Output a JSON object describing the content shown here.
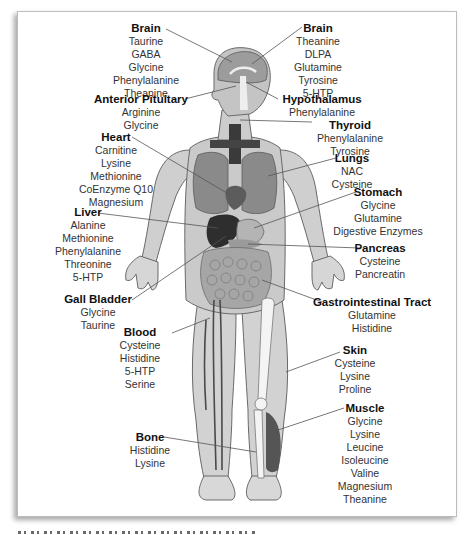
{
  "figure": {
    "type": "anatomical diagram"
  },
  "labels": [
    {
      "id": "brain-left",
      "title": "Brain",
      "items": [
        "Taurine",
        "GABA",
        "Glycine",
        "Phenylalanine",
        "Theanine"
      ]
    },
    {
      "id": "brain-right",
      "title": "Brain",
      "items": [
        "Theanine",
        "DLPA",
        "Glutamine",
        "Tyrosine",
        "5-HTP"
      ]
    },
    {
      "id": "anterior-pituitary",
      "title": "Anterior Pituitary",
      "items": [
        "Arginine",
        "Glycine"
      ]
    },
    {
      "id": "hypothalamus",
      "title": "Hypothalamus",
      "items": [
        "Phenylalanine"
      ]
    },
    {
      "id": "thyroid",
      "title": "Thyroid",
      "items": [
        "Phenylalanine",
        "Tyrosine"
      ]
    },
    {
      "id": "heart",
      "title": "Heart",
      "items": [
        "Carnitine",
        "Lysine",
        "Methionine",
        "CoEnzyme Q10",
        "Magnesium"
      ]
    },
    {
      "id": "lungs",
      "title": "Lungs",
      "items": [
        "NAC",
        "Cysteine"
      ]
    },
    {
      "id": "stomach",
      "title": "Stomach",
      "items": [
        "Glycine",
        "Glutamine",
        "Digestive Enzymes"
      ]
    },
    {
      "id": "liver",
      "title": "Liver",
      "items": [
        "Alanine",
        "Methionine",
        "Phenylalanine",
        "Threonine",
        "5-HTP"
      ]
    },
    {
      "id": "pancreas",
      "title": "Pancreas",
      "items": [
        "Cysteine",
        "Pancreatin"
      ]
    },
    {
      "id": "gall-bladder",
      "title": "Gall Bladder",
      "items": [
        "Glycine",
        "Taurine"
      ]
    },
    {
      "id": "gastrointestinal-tract",
      "title": "Gastrointestinal Tract",
      "items": [
        "Glutamine",
        "Histidine"
      ]
    },
    {
      "id": "blood",
      "title": "Blood",
      "items": [
        "Cysteine",
        "Histidine",
        "5-HTP",
        "Serine"
      ]
    },
    {
      "id": "skin",
      "title": "Skin",
      "items": [
        "Cysteine",
        "Lysine",
        "Proline"
      ]
    },
    {
      "id": "muscle",
      "title": "Muscle",
      "items": [
        "Glycine",
        "Lysine",
        "Leucine",
        "Isoleucine",
        "Valine",
        "Magnesium",
        "Theanine"
      ]
    },
    {
      "id": "bone",
      "title": "Bone",
      "items": [
        "Histidine",
        "Lysine"
      ]
    }
  ],
  "colors": {
    "skin": "#d4d4d4",
    "outline": "#6a6a6a",
    "organ_dark": "#5a5a5a",
    "organ_mid": "#8a8a8a",
    "leader_line": "#555555",
    "frame_border": "#bdbdbd"
  }
}
